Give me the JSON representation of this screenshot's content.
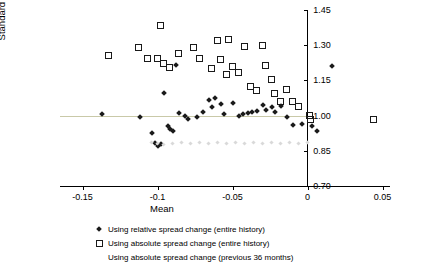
{
  "chart_data": {
    "type": "scatter",
    "title": "",
    "xlabel": "Mean",
    "ylabel": "Standard Deviation",
    "xlim": [
      -0.165,
      0.055
    ],
    "ylim": [
      0.7,
      1.45
    ],
    "xticks": [
      -0.15,
      -0.1,
      -0.05,
      0,
      0.05
    ],
    "xticklabels": [
      "-0.15",
      "-0.1",
      "-0.05",
      "0",
      "0.05"
    ],
    "yticks": [
      0.7,
      0.85,
      1.0,
      1.15,
      1.3,
      1.45
    ],
    "yticklabels": [
      "0.70",
      "0.85",
      "1.00",
      "1.15",
      "1.30",
      "1.45"
    ],
    "grid": false,
    "reference_line_y": 1.0,
    "legend_position": "bottom",
    "series": [
      {
        "name": "Using relative spread change (entire history)",
        "marker": "filled-diamond",
        "color": "#1a1a1a",
        "points": [
          [
            -0.137,
            1.005
          ],
          [
            -0.112,
            0.995
          ],
          [
            -0.104,
            0.925
          ],
          [
            -0.102,
            0.885
          ],
          [
            -0.1,
            0.87
          ],
          [
            -0.098,
            0.88
          ],
          [
            -0.096,
            1.095
          ],
          [
            -0.093,
            0.955
          ],
          [
            -0.092,
            0.945
          ],
          [
            -0.09,
            0.935
          ],
          [
            -0.088,
            1.215
          ],
          [
            -0.086,
            1.01
          ],
          [
            -0.082,
            1.0
          ],
          [
            -0.08,
            0.985
          ],
          [
            -0.074,
            0.995
          ],
          [
            -0.07,
            1.015
          ],
          [
            -0.066,
            1.065
          ],
          [
            -0.064,
            1.035
          ],
          [
            -0.062,
            1.075
          ],
          [
            -0.058,
            1.05
          ],
          [
            -0.056,
            1.005
          ],
          [
            -0.05,
            1.055
          ],
          [
            -0.046,
            1.0
          ],
          [
            -0.043,
            1.005
          ],
          [
            -0.04,
            1.01
          ],
          [
            -0.037,
            1.015
          ],
          [
            -0.034,
            1.02
          ],
          [
            -0.03,
            1.045
          ],
          [
            -0.028,
            1.025
          ],
          [
            -0.024,
            1.035
          ],
          [
            -0.022,
            1.015
          ],
          [
            -0.018,
            1.04
          ],
          [
            -0.014,
            0.995
          ],
          [
            -0.01,
            0.96
          ],
          [
            -0.004,
            0.965
          ],
          [
            0.003,
            0.955
          ],
          [
            0.006,
            0.935
          ],
          [
            0.016,
            1.21
          ]
        ]
      },
      {
        "name": "Using absolute spread change (entire history)",
        "marker": "open-square",
        "color": "#1a1a1a",
        "points": [
          [
            -0.133,
            1.255
          ],
          [
            -0.113,
            1.29
          ],
          [
            -0.107,
            1.245
          ],
          [
            -0.1,
            1.245
          ],
          [
            -0.098,
            1.385
          ],
          [
            -0.096,
            1.22
          ],
          [
            -0.092,
            1.205
          ],
          [
            -0.086,
            1.265
          ],
          [
            -0.076,
            1.29
          ],
          [
            -0.072,
            1.245
          ],
          [
            -0.064,
            1.2
          ],
          [
            -0.06,
            1.32
          ],
          [
            -0.058,
            1.24
          ],
          [
            -0.054,
            1.175
          ],
          [
            -0.053,
            1.325
          ],
          [
            -0.05,
            1.21
          ],
          [
            -0.046,
            1.185
          ],
          [
            -0.042,
            1.295
          ],
          [
            -0.038,
            1.125
          ],
          [
            -0.034,
            1.105
          ],
          [
            -0.03,
            1.3
          ],
          [
            -0.028,
            1.215
          ],
          [
            -0.024,
            1.155
          ],
          [
            -0.022,
            1.095
          ],
          [
            -0.018,
            1.06
          ],
          [
            -0.014,
            1.11
          ],
          [
            -0.01,
            1.06
          ],
          [
            -0.006,
            1.04
          ],
          [
            0.001,
            1.0
          ],
          [
            0.002,
            0.985
          ],
          [
            0.044,
            0.985
          ]
        ]
      },
      {
        "name": "Using absolute spread change (previous 36 months)",
        "marker": "faint-dot",
        "color": "#d9d9d9",
        "points": [
          [
            -0.104,
            0.885
          ],
          [
            -0.1,
            0.88
          ],
          [
            -0.096,
            0.875
          ],
          [
            -0.09,
            0.88
          ],
          [
            -0.084,
            0.885
          ],
          [
            -0.078,
            0.88
          ],
          [
            -0.072,
            0.885
          ],
          [
            -0.066,
            0.88
          ],
          [
            -0.06,
            0.885
          ],
          [
            -0.054,
            0.88
          ],
          [
            -0.048,
            0.885
          ],
          [
            -0.042,
            0.88
          ],
          [
            -0.036,
            0.885
          ],
          [
            -0.03,
            0.88
          ],
          [
            -0.024,
            0.885
          ],
          [
            -0.018,
            0.88
          ],
          [
            -0.012,
            0.885
          ],
          [
            -0.006,
            0.88
          ],
          [
            0.0,
            0.885
          ]
        ]
      }
    ]
  },
  "legend": {
    "items": [
      {
        "label": "Using relative spread change (entire history)",
        "marker": "filled-diamond"
      },
      {
        "label": "Using absolute spread change (entire history)",
        "marker": "open-square"
      },
      {
        "label": "Using absolute spread change (previous 36 months)",
        "marker": "none"
      }
    ]
  }
}
